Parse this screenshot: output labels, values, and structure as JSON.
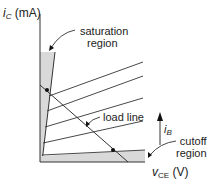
{
  "diagram": {
    "type": "bjt-output-characteristics",
    "y_axis": {
      "var": "i",
      "sub": "C",
      "unit": "(mA)"
    },
    "x_axis": {
      "var": "v",
      "sub": "CE",
      "unit": "(V)"
    },
    "labels": {
      "saturation_line1": "saturation",
      "saturation_line2": "region",
      "load_line": "load line",
      "cutoff_line1": "cutoff",
      "cutoff_line2": "region",
      "ib_var": "i",
      "ib_sub": "B"
    },
    "colors": {
      "line": "#333333",
      "shade": "#d9d9d9",
      "text": "#222222"
    },
    "characteristic_curves": 5,
    "load_line_points": [
      "saturation-edge",
      "cutoff-edge"
    ]
  }
}
